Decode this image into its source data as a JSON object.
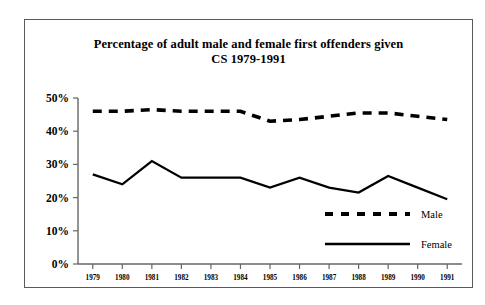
{
  "chart_data": {
    "type": "line",
    "title": "Percentage of adult male and female first offenders given CS 1979-1991",
    "title_lines": [
      "Percentage of adult male and female first offenders given",
      "CS 1979-1991"
    ],
    "xlabel": "",
    "ylabel": "",
    "categories": [
      "1979",
      "1980",
      "1981",
      "1982",
      "1983",
      "1984",
      "1985",
      "1986",
      "1987",
      "1988",
      "1989",
      "1990",
      "1991"
    ],
    "x": [
      1979,
      1980,
      1981,
      1982,
      1983,
      1984,
      1985,
      1986,
      1987,
      1988,
      1989,
      1990,
      1991
    ],
    "ylim": [
      0,
      50
    ],
    "yticks": [
      0,
      10,
      20,
      30,
      40,
      50
    ],
    "ytick_labels": [
      "0%",
      "10%",
      "20%",
      "30%",
      "40%",
      "50%"
    ],
    "grid": false,
    "legend_position": "inside-lower-right",
    "series": [
      {
        "name": "Male",
        "style": "dashed",
        "color": "#000000",
        "values": [
          46,
          46,
          46.5,
          46,
          46,
          46,
          43,
          43.5,
          44.5,
          45.5,
          45.5,
          44.5,
          43.5
        ]
      },
      {
        "name": "Female",
        "style": "solid",
        "color": "#000000",
        "values": [
          27,
          24,
          31,
          26,
          26,
          26,
          23,
          26,
          23,
          21.5,
          26.5,
          23,
          19.5
        ]
      }
    ]
  },
  "legend": {
    "entries": [
      {
        "label": "Male"
      },
      {
        "label": "Female"
      }
    ]
  },
  "colors": {
    "ink": "#000000",
    "axis": "#666666",
    "frame": "#5a5a5a",
    "page": "#ffffff"
  }
}
